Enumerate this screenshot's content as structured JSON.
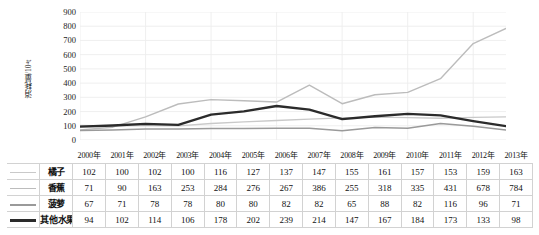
{
  "chart_data": {
    "type": "line",
    "title": "",
    "xlabel": "",
    "ylabel": "消耗量/10⁴t",
    "ylim": [
      0,
      900
    ],
    "ytick_step": 100,
    "yticks": [
      900,
      800,
      700,
      600,
      500,
      400,
      300,
      200,
      100,
      0
    ],
    "grid": true,
    "legend_position": "table-left",
    "categories": [
      "2000年",
      "2001年",
      "2002年",
      "2003年",
      "2004年",
      "2005年",
      "2006年",
      "2007年",
      "2008年",
      "2009年",
      "2010年",
      "2011年",
      "2012年",
      "2013年"
    ],
    "series": [
      {
        "name": "橘子",
        "color": "#c9c9c9",
        "width": 1.3,
        "values": [
          102,
          100,
          102,
          100,
          116,
          127,
          137,
          147,
          155,
          161,
          157,
          153,
          159,
          163
        ]
      },
      {
        "name": "香蕉",
        "color": "#bcbcbc",
        "width": 1.4,
        "values": [
          71,
          90,
          163,
          253,
          284,
          276,
          267,
          386,
          255,
          318,
          335,
          431,
          678,
          784
        ]
      },
      {
        "name": "菠萝",
        "color": "#9a9a9a",
        "width": 1.5,
        "values": [
          67,
          71,
          78,
          78,
          80,
          80,
          82,
          82,
          65,
          88,
          82,
          116,
          96,
          71
        ]
      },
      {
        "name": "其他水果",
        "color": "#2b2b2b",
        "width": 2.3,
        "values": [
          94,
          102,
          114,
          106,
          178,
          202,
          239,
          214,
          147,
          167,
          184,
          173,
          133,
          98
        ]
      }
    ]
  },
  "table": {
    "header_years": [
      "2000年",
      "2001年",
      "2002年",
      "2003年",
      "2004年",
      "2005年",
      "2006年",
      "2007年",
      "2008年",
      "2009年",
      "2010年",
      "2011年",
      "2012年",
      "2013年"
    ],
    "rows": [
      {
        "label": "橘子",
        "swatch_color": "#c9c9c9",
        "swatch_height": 1.3,
        "values": [
          "102",
          "100",
          "102",
          "100",
          "116",
          "127",
          "137",
          "147",
          "155",
          "161",
          "157",
          "153",
          "159",
          "163"
        ]
      },
      {
        "label": "香蕉",
        "swatch_color": "#bcbcbc",
        "swatch_height": 1.6,
        "values": [
          "71",
          "90",
          "163",
          "253",
          "284",
          "276",
          "267",
          "386",
          "255",
          "318",
          "335",
          "431",
          "678",
          "784"
        ]
      },
      {
        "label": "菠萝",
        "swatch_color": "#9a9a9a",
        "swatch_height": 2,
        "values": [
          "67",
          "71",
          "78",
          "78",
          "80",
          "80",
          "82",
          "82",
          "65",
          "88",
          "82",
          "116",
          "96",
          "71"
        ]
      },
      {
        "label": "其他水果",
        "swatch_color": "#2b2b2b",
        "swatch_height": 2.8,
        "values": [
          "94",
          "102",
          "114",
          "106",
          "178",
          "202",
          "239",
          "214",
          "147",
          "167",
          "184",
          "173",
          "133",
          "98"
        ]
      }
    ]
  },
  "colors": {
    "grid": "#ededed",
    "border": "#d2d2d2",
    "text": "#1a1a1a",
    "background": "#ffffff"
  }
}
